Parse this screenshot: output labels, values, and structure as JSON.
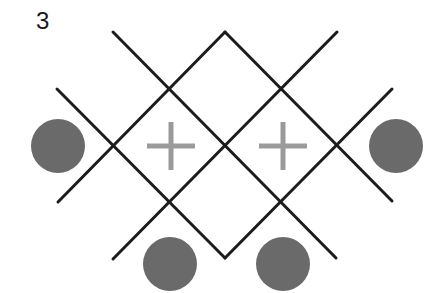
{
  "figure": {
    "label": "3",
    "colors": {
      "line": "#1c1c1c",
      "circle": "#6a6a6a",
      "plus": "#9a9a9a",
      "background": "#ffffff"
    },
    "lines": [
      {
        "id": "line-a",
        "x1": 57,
        "y1": 89,
        "x2": 225,
        "y2": 258
      },
      {
        "id": "line-b",
        "x1": 113,
        "y1": 32,
        "x2": 336,
        "y2": 258
      },
      {
        "id": "line-c",
        "x1": 113,
        "y1": 259,
        "x2": 337,
        "y2": 32
      },
      {
        "id": "line-d",
        "x1": 58,
        "y1": 202,
        "x2": 225,
        "y2": 32
      },
      {
        "id": "line-e",
        "x1": 225,
        "y1": 32,
        "x2": 392,
        "y2": 201
      },
      {
        "id": "line-f",
        "x1": 225,
        "y1": 258,
        "x2": 392,
        "y2": 89
      }
    ],
    "circles": [
      {
        "id": "circle-left",
        "cx": 58,
        "cy": 146,
        "r": 27
      },
      {
        "id": "circle-right",
        "cx": 396,
        "cy": 146,
        "r": 27
      },
      {
        "id": "circle-bottom-left",
        "cx": 170,
        "cy": 264,
        "r": 27
      },
      {
        "id": "circle-bottom-right",
        "cx": 283,
        "cy": 264,
        "r": 27
      }
    ],
    "plus_signs": [
      {
        "id": "plus-left",
        "cx": 171,
        "cy": 146,
        "half": 24
      },
      {
        "id": "plus-right",
        "cx": 283,
        "cy": 146,
        "half": 24
      }
    ]
  }
}
